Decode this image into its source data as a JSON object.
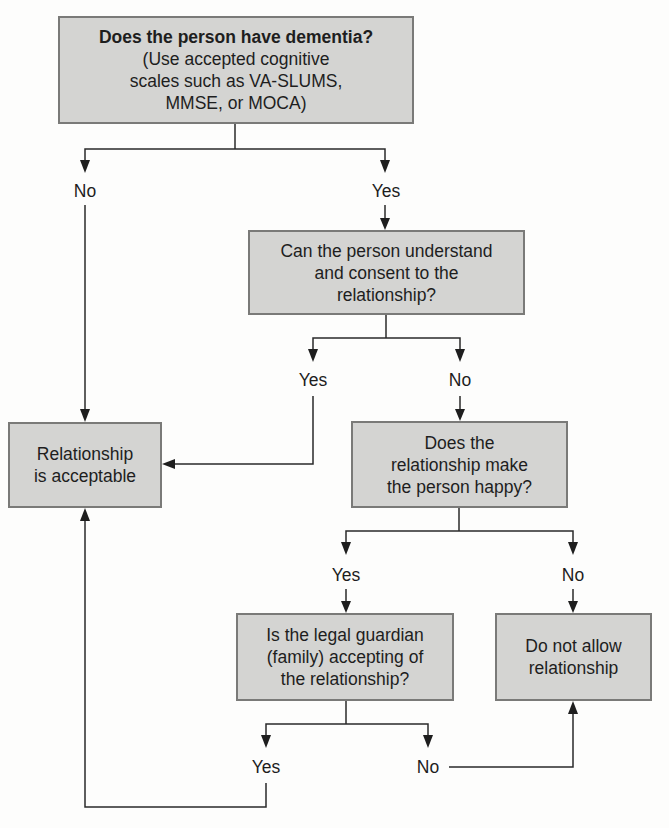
{
  "diagram": {
    "type": "flowchart",
    "nodes": {
      "dementia": {
        "title": "Does the person have dementia?",
        "subtitle_line1": "(Use accepted cognitive",
        "subtitle_line2": "scales such as VA-SLUMS,",
        "subtitle_line3": "MMSE, or MOCA)"
      },
      "consent": {
        "line1": "Can the person understand",
        "line2": "and consent to the",
        "line3": "relationship?"
      },
      "acceptable": {
        "line1": "Relationship",
        "line2": "is acceptable"
      },
      "happy": {
        "line1": "Does the",
        "line2": "relationship make",
        "line3": "the person happy?"
      },
      "guardian": {
        "line1": "Is the legal guardian",
        "line2": "(family) accepting of",
        "line3": "the relationship?"
      },
      "disallow": {
        "line1": "Do not allow",
        "line2": "relationship"
      }
    },
    "labels": {
      "dementia_no": "No",
      "dementia_yes": "Yes",
      "consent_yes": "Yes",
      "consent_no": "No",
      "happy_yes": "Yes",
      "happy_no": "No",
      "guardian_yes": "Yes",
      "guardian_no": "No"
    },
    "edges": [
      {
        "from": "dementia",
        "label": "No",
        "to": "acceptable"
      },
      {
        "from": "dementia",
        "label": "Yes",
        "to": "consent"
      },
      {
        "from": "consent",
        "label": "Yes",
        "to": "acceptable"
      },
      {
        "from": "consent",
        "label": "No",
        "to": "happy"
      },
      {
        "from": "happy",
        "label": "Yes",
        "to": "guardian"
      },
      {
        "from": "happy",
        "label": "No",
        "to": "disallow"
      },
      {
        "from": "guardian",
        "label": "Yes",
        "to": "acceptable"
      },
      {
        "from": "guardian",
        "label": "No",
        "to": "disallow"
      }
    ],
    "colors": {
      "box_fill": "#d4d4d2",
      "box_border": "#7a7a78",
      "line": "#2a2a2a",
      "text": "#1e1e1e"
    }
  }
}
